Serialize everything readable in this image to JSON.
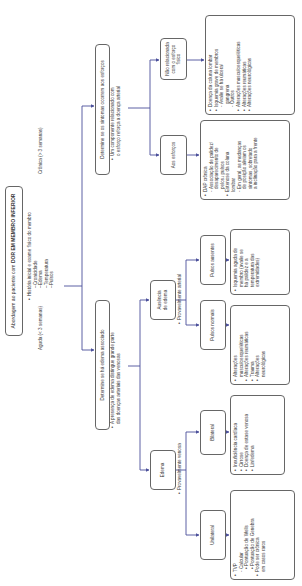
{
  "root": {
    "prefix": "Abordagem ao paciente com ",
    "emphasis": "DOR EM MEMBRO INFERIOR"
  },
  "history": {
    "intro": "História inicial e exame físico do membro",
    "items": [
      "Cronicidade",
      "Edema",
      "Temperatura",
      "Pulsos"
    ]
  },
  "branches": {
    "chronic_label": "Crônica (> 3 semanas)",
    "acute_label": "Aguda (< 3 semanas)"
  },
  "chronic": {
    "question": "Determine se os sintomas ocorrem aos esforços",
    "note": [
      "Um componente relacionado com",
      "o esforço reforça a doença arterial"
    ],
    "not_related": {
      "label": [
        "Não relacionada",
        "com o esforço físico"
      ]
    },
    "on_exertion": {
      "label": "Aos esforços"
    },
    "not_related_list": [
      {
        "t": "b",
        "text": "Doença da coluna lombar"
      },
      {
        "t": "b",
        "text": "Isquemia grave de membros"
      },
      {
        "t": "s",
        "text": "Avalie se há úlcera/"
      },
      {
        "t": "c",
        "text": "gangrena"
      },
      {
        "t": "s",
        "text": "Outros"
      },
      {
        "t": "b",
        "text": "Alterações musculoesqueléticas"
      },
      {
        "t": "b",
        "text": "Alterações reumáticas"
      },
      {
        "t": "b",
        "text": "Alterações neurológicas"
      }
    ],
    "exertion_list": [
      {
        "t": "b",
        "text": "DAP crônica"
      },
      {
        "t": "s",
        "text": "Associação de palidez/"
      },
      {
        "t": "c",
        "text": "desaparecimento de"
      },
      {
        "t": "c",
        "text": "pelos↓ pulsos"
      },
      {
        "t": "b",
        "text": "Estenose da coluna"
      },
      {
        "t": "c",
        "text": "lombar"
      },
      {
        "t": "s",
        "text": "Em geral, as mudanças"
      },
      {
        "t": "c",
        "text": "de posição aliviam os"
      },
      {
        "t": "c",
        "text": "sintomas, sobretudo"
      },
      {
        "t": "c",
        "text": "a inclinação para a frente"
      }
    ]
  },
  "acute": {
    "question": "Determine se há edema associado",
    "note": [
      "A presença de edema distingue grande parte",
      "das doenças arteriais das venosas"
    ],
    "no_edema": {
      "label": [
        "Ausência",
        "de edema"
      ],
      "note": "Provavelmente arterial",
      "absent_pulses": {
        "label": "Pulsos ausentes",
        "list": [
          {
            "t": "b",
            "text": "Isquemia aguda de"
          },
          {
            "t": "c",
            "text": "membro (avalie se"
          },
          {
            "t": "c",
            "text": "há palidez e a"
          },
          {
            "t": "c",
            "text": "temperatura das"
          },
          {
            "t": "c",
            "text": "extremidades)"
          }
        ]
      },
      "normal_pulses": {
        "label": "Pulsos normais",
        "list": [
          {
            "t": "b",
            "text": "Alterações"
          },
          {
            "t": "c",
            "text": "musculoesqueléticas"
          },
          {
            "t": "b",
            "text": "Alterações reumáticas"
          },
          {
            "t": "b",
            "text": "Trauma"
          },
          {
            "t": "b",
            "text": "Alterações"
          },
          {
            "t": "c",
            "text": "neurológicas"
          }
        ]
      }
    },
    "edema": {
      "label": "Edema",
      "note": "Provavelmente venosa",
      "bilateral": {
        "label": "Bilateral",
        "list": [
          {
            "t": "b",
            "text": "Insuficiência cardíaca"
          },
          {
            "t": "b",
            "text": "Cirrose"
          },
          {
            "t": "b",
            "text": "Doença de estase venosa"
          },
          {
            "t": "b",
            "text": "Linfedema"
          }
        ]
      },
      "unilateral": {
        "label": "Unilateral",
        "list": [
          {
            "t": "b",
            "text": "TVP"
          },
          {
            "t": "s",
            "text": "Calcular"
          },
          {
            "t": "s2",
            "text": "Pontuação de Wells"
          },
          {
            "t": "s2",
            "text": "Pontuação de Genebra"
          },
          {
            "t": "b",
            "text": "Pode ser crônica"
          },
          {
            "t": "c",
            "text": "em casos raros"
          }
        ]
      }
    }
  },
  "colors": {
    "line": "#4a4f9a",
    "border": "#666666"
  }
}
